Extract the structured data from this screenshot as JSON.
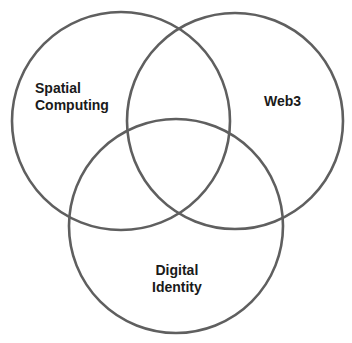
{
  "diagram": {
    "type": "venn",
    "stroke_color": "#5f5f5f",
    "text_color": "#1a1a1a",
    "circles": [
      {
        "id": "spatial-computing",
        "cx": 121,
        "cy": 121,
        "r": 109,
        "label_lines": [
          "Spatial",
          "Computing"
        ]
      },
      {
        "id": "web3",
        "cx": 235,
        "cy": 121,
        "r": 108,
        "label_lines": [
          "Web3"
        ]
      },
      {
        "id": "digital-identity",
        "cx": 176,
        "cy": 226,
        "r": 107,
        "label_lines": [
          "Digital",
          "Identity"
        ]
      }
    ]
  }
}
